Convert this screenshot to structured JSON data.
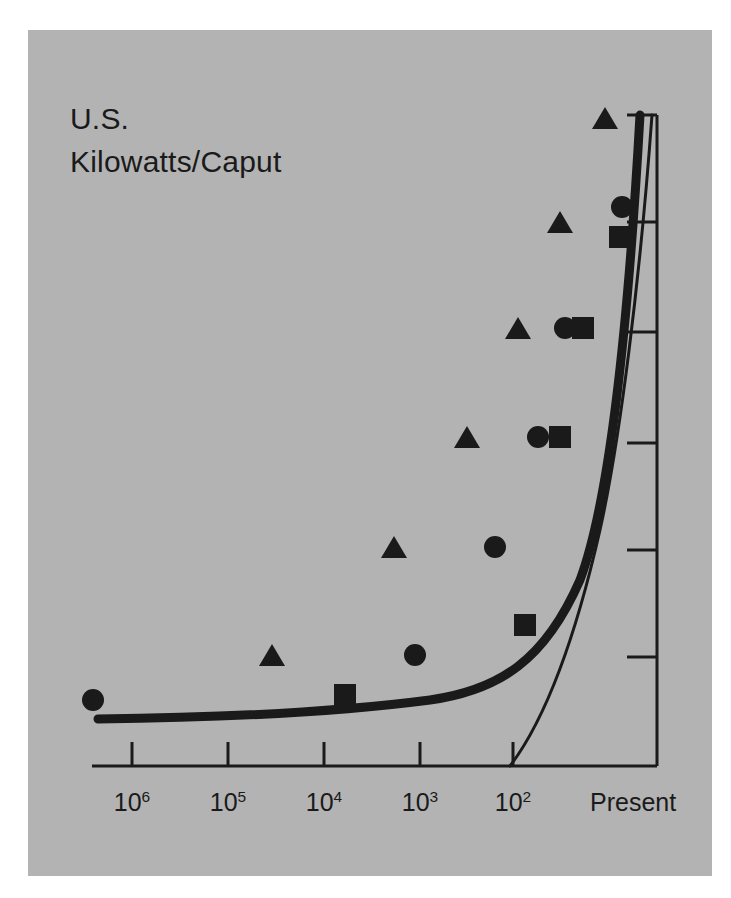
{
  "figure": {
    "background_color": "#ffffff",
    "panel_color": "#b3b3b3",
    "ink_color": "#1a1a1a"
  },
  "title": {
    "line1": "U.S.",
    "line2": "Kilowatts/Caput"
  },
  "chart_data": {
    "type": "scatter",
    "title": "U.S. Kilowatts/Caput",
    "subtitle": "",
    "xlabel": "",
    "ylabel": "Kilowatts/Caput",
    "grid": false,
    "legend_position": "none",
    "x_axis": {
      "description": "Years before present, logarithmic, decreasing to the right",
      "tick_labels": [
        "10⁶",
        "10⁵",
        "10⁴",
        "10³",
        "10²",
        "Present"
      ],
      "tick_bases": [
        "10",
        "10",
        "10",
        "10",
        "10",
        ""
      ],
      "tick_exponents": [
        "6",
        "5",
        "4",
        "3",
        "2",
        ""
      ],
      "tick_values": [
        1000000,
        100000,
        10000,
        1000,
        100,
        1
      ],
      "tick_x_px": [
        132,
        228,
        324,
        420,
        513,
        620
      ],
      "axis_line_y_px": 766,
      "axis_left_px": 92,
      "axis_right_px": 657
    },
    "y_axis": {
      "description": "Kilowatts per caput, unlabeled tick marks on right-hand vertical axis",
      "tick_labels": [
        "",
        "",
        "",
        "",
        "",
        ""
      ],
      "tick_y_px": [
        115,
        222,
        332,
        443,
        550,
        657
      ],
      "axis_line_x_px": 657,
      "axis_top_px": 115,
      "axis_bottom_px": 766
    },
    "series": [
      {
        "name": "triangle-series",
        "marker": "triangle",
        "points": [
          {
            "x_px": 272,
            "y_px": 655
          },
          {
            "x_px": 394,
            "y_px": 547
          },
          {
            "x_px": 467,
            "y_px": 437
          },
          {
            "x_px": 518,
            "y_px": 328
          },
          {
            "x_px": 560,
            "y_px": 222
          },
          {
            "x_px": 605,
            "y_px": 118
          }
        ]
      },
      {
        "name": "circle-series",
        "marker": "circle",
        "points": [
          {
            "x_px": 93,
            "y_px": 700
          },
          {
            "x_px": 415,
            "y_px": 655
          },
          {
            "x_px": 495,
            "y_px": 547
          },
          {
            "x_px": 538,
            "y_px": 437
          },
          {
            "x_px": 565,
            "y_px": 328
          },
          {
            "x_px": 622,
            "y_px": 207
          }
        ]
      },
      {
        "name": "square-series",
        "marker": "square",
        "points": [
          {
            "x_px": 345,
            "y_px": 695
          },
          {
            "x_px": 525,
            "y_px": 625
          },
          {
            "x_px": 560,
            "y_px": 437
          },
          {
            "x_px": 583,
            "y_px": 328
          },
          {
            "x_px": 620,
            "y_px": 237
          }
        ]
      }
    ],
    "curves": [
      {
        "name": "thick-curve",
        "stroke_width": 9,
        "path": "M 98 719 C 200 718, 330 713, 430 700 C 500 690, 545 660, 580 580 C 610 500, 628 330, 640 115"
      },
      {
        "name": "thin-curve",
        "stroke_width": 3,
        "path": "M 510 766 C 545 720, 575 640, 600 530 C 620 440, 640 280, 652 115"
      }
    ]
  }
}
